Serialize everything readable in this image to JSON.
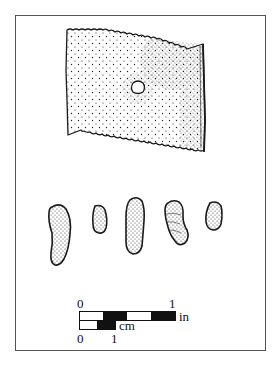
{
  "figure": {
    "type": "archaeological artifact illustration",
    "artifacts": [
      {
        "name": "perforated-rectangular-sheet",
        "description": "stippled rectangular sheet with serrated edges and a central circular perforation"
      },
      {
        "name": "elongated-bead-1"
      },
      {
        "name": "elongated-bead-2"
      },
      {
        "name": "elongated-bead-3"
      },
      {
        "name": "elongated-bead-4"
      },
      {
        "name": "elongated-bead-5"
      }
    ]
  },
  "scale_bar": {
    "inch": {
      "start_label": "0",
      "end_label": "1",
      "unit_label": "in"
    },
    "cm": {
      "start_label": "0",
      "end_label": "1",
      "unit_label": "cm"
    }
  },
  "colors": {
    "ink": "#1a1a1a",
    "background": "#ffffff",
    "frame": "#555555"
  }
}
